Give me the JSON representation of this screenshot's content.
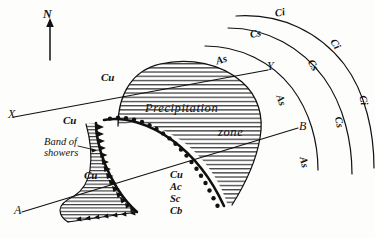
{
  "figure": {
    "type": "meteorological-frontal-cyclone-diagram",
    "background_color": "#fdfdfc",
    "ink_color": "#111111",
    "width": 375,
    "height": 238
  },
  "orientation": {
    "north_label": "N"
  },
  "section_lines": {
    "x_label": "X",
    "y_label": "Y",
    "a_label": "A",
    "b_label": "B"
  },
  "zones": {
    "precipitation_line1": "Precipitation",
    "precipitation_line2": "zone",
    "band_of_showers_line1": "Band of",
    "band_of_showers_line2": "showers"
  },
  "cloud_labels": {
    "cu_upper": "Cu",
    "cu_middle": "Cu",
    "cu_lower": "Cu",
    "as_top": "As",
    "as_right_upper": "As",
    "as_right_lower": "As",
    "cs_upper": "Cs",
    "cs_middle": "Cs",
    "cs_lower": "Cs",
    "ci_upper": "Ci",
    "ci_middle": "Ci",
    "ci_lower": "Ci"
  },
  "cloud_list": {
    "items": [
      "Cu",
      "Ac",
      "Sc",
      "Cb"
    ]
  },
  "fronts": {
    "cold_front_name": "cold-front",
    "cold_front_symbol": "triangular-barbs",
    "warm_front_name": "warm-front",
    "warm_front_symbol": "semicircle-bumps"
  }
}
